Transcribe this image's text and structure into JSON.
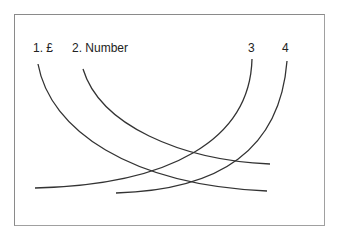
{
  "diagram": {
    "labels": [
      {
        "id": "1",
        "text": "1. £",
        "x": 33,
        "y": 42
      },
      {
        "id": "2",
        "text": "2. Number",
        "x": 72,
        "y": 42
      },
      {
        "id": "3",
        "text": "3",
        "x": 248,
        "y": 42
      },
      {
        "id": "4",
        "text": "4",
        "x": 282,
        "y": 42
      }
    ],
    "curves": [
      {
        "id": "1",
        "d": "M38 64 C 50 130, 130 185, 267 191"
      },
      {
        "id": "2",
        "d": "M83 69 C 100 125, 180 160, 270 164"
      },
      {
        "id": "3",
        "d": "M252 59 C 250 140, 170 185, 35 188"
      },
      {
        "id": "4",
        "d": "M287 61 C 280 150, 220 190, 116 193"
      }
    ],
    "stroke_color": "#333333",
    "frame_color": "#8a8a8a"
  }
}
